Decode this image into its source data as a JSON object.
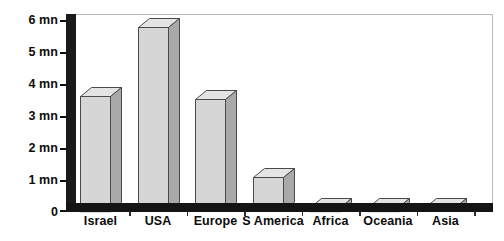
{
  "chart_data": {
    "type": "bar",
    "title": "",
    "subtitle": "",
    "xlabel": "",
    "ylabel": "",
    "categories": [
      "Israel",
      "USA",
      "Europe",
      "S America",
      "Africa",
      "Oceania",
      "Asia"
    ],
    "values": [
      3.6,
      5.75,
      3.5,
      1.05,
      0.13,
      0.13,
      0.12
    ],
    "ylim": [
      0,
      6
    ],
    "ytick_values": [
      0,
      1,
      2,
      3,
      4,
      5,
      6
    ],
    "ytick_labels": [
      "0",
      "1 mn",
      "2 mn",
      "3 mn",
      "4 mn",
      "5 mn",
      "6 mn"
    ],
    "unit": "mn",
    "grid": false,
    "legend": null,
    "style": "3d-column",
    "colors": {
      "bar_front": "#d6d6d6",
      "bar_side": "#a9a9a9",
      "bar_top": "#e4e4e4",
      "bar_outline": "#4a4a4a",
      "axis_wall": "#1a1a1a",
      "floor": "#141414",
      "plot_border": "#b9b9b9",
      "background": "#ffffff",
      "text": "#0c0c0c"
    }
  }
}
